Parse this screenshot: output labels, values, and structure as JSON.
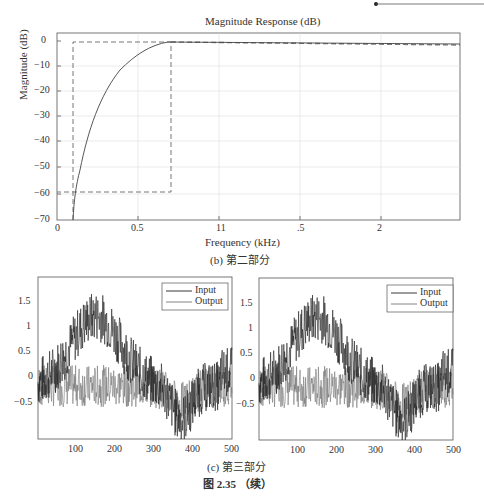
{
  "header_decoration": {
    "type": "line-with-dot"
  },
  "chart_data": [
    {
      "type": "line",
      "title": "Magnitude Response (dB)",
      "xlabel": "Frequency (kHz)",
      "ylabel": "Magnitude (dB)",
      "xticks": [
        "0",
        "0.5",
        "11",
        ".5",
        "2"
      ],
      "yticks": [
        "0",
        "-10",
        "-20",
        "-30",
        "-40",
        "-50",
        "-60",
        "-70"
      ],
      "ylim": [
        -70,
        2
      ],
      "grid": true,
      "series": [
        {
          "name": "filter response",
          "style": "solid",
          "points": [
            [
              0.1,
              -70
            ],
            [
              0.12,
              -55
            ],
            [
              0.15,
              -40
            ],
            [
              0.2,
              -27
            ],
            [
              0.3,
              -14
            ],
            [
              0.4,
              -7
            ],
            [
              0.5,
              -3
            ],
            [
              0.6,
              -1
            ],
            [
              0.7,
              0
            ],
            [
              2.5,
              -1
            ]
          ]
        },
        {
          "name": "specification mask",
          "style": "dashed",
          "points": [
            [
              0.1,
              -70
            ],
            [
              0.1,
              -0.5
            ],
            [
              0.7,
              -0.5
            ],
            [
              0.7,
              -59
            ],
            [
              0.0,
              -59
            ]
          ]
        }
      ],
      "caption": "(b) 第二部分"
    },
    {
      "type": "line",
      "title": "",
      "xticks": [
        "100",
        "200",
        "300",
        "400",
        "500"
      ],
      "yticks": [
        "1.5",
        "1",
        "0.5",
        "0",
        "-0.5"
      ],
      "xlim": [
        0,
        500
      ],
      "ylim": [
        -0.95,
        1.95
      ],
      "legend": [
        "Input",
        "Output"
      ],
      "legend_position": "upper right",
      "series": [
        {
          "name": "Input",
          "description": "noisy smooth bump peaking ~1.3 near x=150, dip to ~-0.7 near x=370"
        },
        {
          "name": "Output",
          "description": "noise around 0 with amplitude ~0.4"
        }
      ]
    },
    {
      "type": "line",
      "title": "",
      "xticks": [
        "100",
        "200",
        "300",
        "400",
        "500"
      ],
      "yticks": [
        "1.5",
        "1",
        "0.5",
        "0",
        "-0.5"
      ],
      "xlim": [
        0,
        500
      ],
      "ylim": [
        -0.95,
        1.95
      ],
      "legend": [
        "Input",
        "Output"
      ],
      "legend_position": "upper right",
      "series": [
        {
          "name": "Input",
          "description": "noisy smooth bump peaking ~1.3 near x=150, dip to ~-0.7 near x=370"
        },
        {
          "name": "Output",
          "description": "noise around 0 with amplitude ~0.4"
        }
      ]
    }
  ],
  "captions": {
    "c": "(c) 第三部分",
    "figure": "图 2.35  （续）"
  }
}
